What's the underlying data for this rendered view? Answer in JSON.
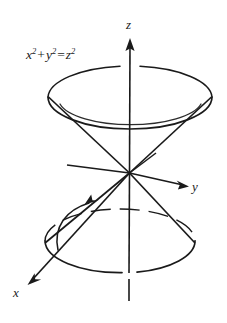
{
  "figure": {
    "equation": {
      "full": "x^2 + y^2 = z^2",
      "lhs_first_base": "x",
      "lhs_first_exp": "2",
      "plus": "+",
      "lhs_second_base": "y",
      "lhs_second_exp": "2",
      "equals": "=",
      "rhs_base": "z",
      "rhs_exp": "2"
    },
    "axes": [
      {
        "name": "z",
        "label": "z",
        "direction": "up",
        "label_x": 126,
        "label_y": 18
      },
      {
        "name": "y",
        "label": "y",
        "direction": "right-down",
        "label_x": 192,
        "label_y": 180
      },
      {
        "name": "x",
        "label": "x",
        "direction": "left-down",
        "label_x": 13,
        "label_y": 286
      }
    ],
    "colors": {
      "stroke": "#1a1a1a",
      "background": "#ffffff",
      "label": "#1a1a1a"
    },
    "geometry": {
      "apex": {
        "x": 129,
        "y": 173
      },
      "top_ellipse": {
        "cx": 130,
        "cy": 97,
        "rx": 82,
        "ry": 32
      },
      "bottom_ellipse": {
        "cx": 120,
        "cy": 240,
        "rx": 75,
        "ry": 32
      },
      "z_axis_top_y": 40,
      "z_axis_bottom_y": 300,
      "y_axis_tip": {
        "x": 187,
        "y": 186
      },
      "x_axis_tip": {
        "x": 28,
        "y": 283
      },
      "neg_y_ray_tip": {
        "x": 67,
        "y": 165
      }
    }
  }
}
